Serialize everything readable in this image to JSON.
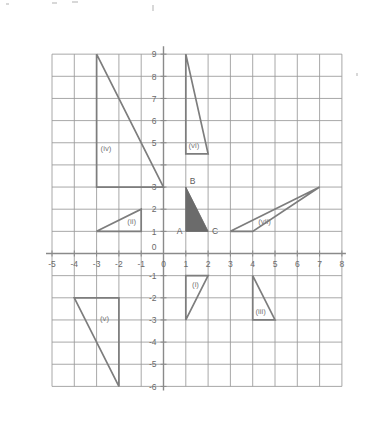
{
  "figure": {
    "title": "",
    "background_color": "#ffffff",
    "grid_color": "#9a9a9a",
    "axis_color": "#8a8a8a",
    "shape_stroke_color": "#7d7d7d",
    "shaded_fill_color": "#6b6b6b",
    "label_color": "#6a6a6a"
  },
  "chart_data": {
    "type": "scatter",
    "title": "",
    "xlabel": "",
    "ylabel": "",
    "xlim": [
      -5,
      8
    ],
    "ylim": [
      -6,
      9
    ],
    "grid": true,
    "grid_step": 1,
    "legend_position": "none",
    "x_tick_labels": [
      "-5",
      "-4",
      "-3",
      "-2",
      "-1",
      "0",
      "1",
      "2",
      "3",
      "4",
      "5",
      "6",
      "7",
      "8"
    ],
    "x_tick_values": [
      -5,
      -4,
      -3,
      -2,
      -1,
      0,
      1,
      2,
      3,
      4,
      5,
      6,
      7,
      8
    ],
    "y_tick_labels": [
      "9",
      "8",
      "7",
      "6",
      "5",
      "4",
      "3",
      "2",
      "1",
      "0",
      "-1",
      "-2",
      "-3",
      "-4",
      "-5",
      "-6"
    ],
    "y_tick_values": [
      9,
      8,
      7,
      6,
      5,
      4,
      3,
      2,
      1,
      0,
      -1,
      -2,
      -3,
      -4,
      -5,
      -6
    ],
    "y_tick_labels_shown": [
      "9",
      "8",
      "7",
      "6",
      "5",
      "3",
      "2",
      "1",
      "0",
      "-1",
      "-2",
      "-3",
      "-4",
      "-5",
      "-6"
    ],
    "shapes": [
      {
        "id": "shape-i",
        "label": "(i)",
        "label_x": 1.28,
        "label_y": -1.52,
        "points": [
          [
            1,
            -1
          ],
          [
            2,
            -1
          ],
          [
            1,
            -3
          ]
        ],
        "filled": false
      },
      {
        "id": "shape-ii",
        "label": "(ii)",
        "label_x": -1.62,
        "label_y": 1.32,
        "points": [
          [
            -3,
            1
          ],
          [
            -1,
            1
          ],
          [
            -1,
            2
          ]
        ],
        "filled": false
      },
      {
        "id": "shape-iii",
        "label": "(iii)",
        "label_x": 4.12,
        "label_y": -2.72,
        "points": [
          [
            4,
            -1
          ],
          [
            4,
            -3
          ],
          [
            5,
            -3
          ]
        ],
        "filled": false
      },
      {
        "id": "shape-iv",
        "label": "(iv)",
        "label_x": -2.82,
        "label_y": 4.62,
        "points": [
          [
            -3,
            9
          ],
          [
            -3,
            3
          ],
          [
            0,
            3
          ]
        ],
        "filled": false
      },
      {
        "id": "shape-v",
        "label": "(v)",
        "label_x": -2.85,
        "label_y": -3.05,
        "points": [
          [
            -4,
            -2
          ],
          [
            -2,
            -2
          ],
          [
            -2,
            -6
          ]
        ],
        "filled": false
      },
      {
        "id": "shape-vi",
        "label": "(vi)",
        "label_x": 1.12,
        "label_y": 4.78,
        "points": [
          [
            1,
            9
          ],
          [
            1,
            4.5
          ],
          [
            2,
            4.5
          ]
        ],
        "filled": false
      },
      {
        "id": "shape-vii",
        "label": "(vii)",
        "label_x": 4.25,
        "label_y": 1.35,
        "points": [
          [
            3,
            1
          ],
          [
            4,
            1
          ],
          [
            7,
            3
          ]
        ],
        "filled": false
      },
      {
        "id": "shape-abc",
        "label": "",
        "label_x": 0,
        "label_y": 0,
        "points": [
          [
            1,
            1
          ],
          [
            1,
            3
          ],
          [
            2,
            1
          ]
        ],
        "filled": true
      }
    ],
    "vertex_labels": [
      {
        "id": "vertex-a",
        "text": "A",
        "x": 1,
        "y": 1,
        "dx": -9,
        "dy": 3
      },
      {
        "id": "vertex-b",
        "text": "B",
        "x": 1,
        "y": 3,
        "dx": 4,
        "dy": -3
      },
      {
        "id": "vertex-c",
        "text": "C",
        "x": 2,
        "y": 1,
        "dx": 4,
        "dy": 3
      }
    ]
  }
}
